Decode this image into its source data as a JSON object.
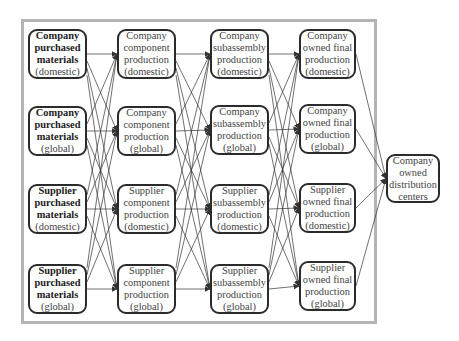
{
  "diagram": {
    "type": "supply-chain network",
    "columns": [
      {
        "stage": "purchased materials",
        "nodes": [
          {
            "id": "c1r1",
            "lines": [
              "Company",
              "purchased",
              "materials",
              "(domestic)"
            ],
            "bold_lines": 3
          },
          {
            "id": "c1r2",
            "lines": [
              "Company",
              "purchased",
              "materials",
              "(global)"
            ],
            "bold_lines": 3
          },
          {
            "id": "c1r3",
            "lines": [
              "Supplier",
              "purchased",
              "materials",
              "(domestic)"
            ],
            "bold_lines": 3
          },
          {
            "id": "c1r4",
            "lines": [
              "Supplier",
              "purchased",
              "materials",
              "(global)"
            ],
            "bold_lines": 3
          }
        ]
      },
      {
        "stage": "component production",
        "nodes": [
          {
            "id": "c2r1",
            "lines": [
              "Company",
              "component",
              "production",
              "(domestic)"
            ]
          },
          {
            "id": "c2r2",
            "lines": [
              "Company",
              "component",
              "production",
              "(global)"
            ]
          },
          {
            "id": "c2r3",
            "lines": [
              "Supplier",
              "component",
              "production",
              "(domestic)"
            ]
          },
          {
            "id": "c2r4",
            "lines": [
              "Supplier",
              "component",
              "production",
              "(global)"
            ]
          }
        ]
      },
      {
        "stage": "subassembly production",
        "nodes": [
          {
            "id": "c3r1",
            "lines": [
              "Company",
              "subassembly",
              "production",
              "(domestic)"
            ]
          },
          {
            "id": "c3r2",
            "lines": [
              "Company",
              "subassembly",
              "production",
              "(global)"
            ]
          },
          {
            "id": "c3r3",
            "lines": [
              "Supplier",
              "subassembly",
              "production",
              "(domestic)"
            ]
          },
          {
            "id": "c3r4",
            "lines": [
              "Supplier",
              "subassembly",
              "production",
              "(global)"
            ]
          }
        ]
      },
      {
        "stage": "final production",
        "nodes": [
          {
            "id": "c4r1",
            "lines": [
              "Company",
              "owned final",
              "production",
              "(domestic)"
            ]
          },
          {
            "id": "c4r2",
            "lines": [
              "Company",
              "owned final",
              "production",
              "(global)"
            ]
          },
          {
            "id": "c4r3",
            "lines": [
              "Supplier",
              "owned final",
              "production",
              "(domestic)"
            ]
          },
          {
            "id": "c4r4",
            "lines": [
              "Supplier",
              "owned final",
              "production",
              "(global)"
            ]
          }
        ]
      }
    ],
    "sink": {
      "id": "dist",
      "lines": [
        "Company",
        "owned",
        "distribution",
        "centers"
      ]
    },
    "edges_rule": "every node in column N connects with an arrow to every node in column N+1; every final-production node connects to distribution centers",
    "colors": {
      "box_border": "#2b2b2b",
      "frame_border": "#b4b4b4",
      "line": "#333333",
      "background": "#ffffff"
    }
  }
}
